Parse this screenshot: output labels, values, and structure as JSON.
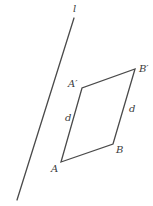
{
  "diagram": {
    "line": {
      "label": "l",
      "x1": 74,
      "y1": 18,
      "x2": 17,
      "y2": 200
    },
    "points": {
      "A": {
        "label": "A",
        "x": 61,
        "y": 162
      },
      "B": {
        "label": "B",
        "x": 113,
        "y": 144
      },
      "A_prime": {
        "label": "A′",
        "x": 82,
        "y": 88
      },
      "B_prime": {
        "label": "B′",
        "x": 135,
        "y": 69
      }
    },
    "segment_labels": {
      "left": "d",
      "right": "d"
    },
    "stroke_color": "#4a4a4a",
    "label_color": "#3a3a3a"
  }
}
